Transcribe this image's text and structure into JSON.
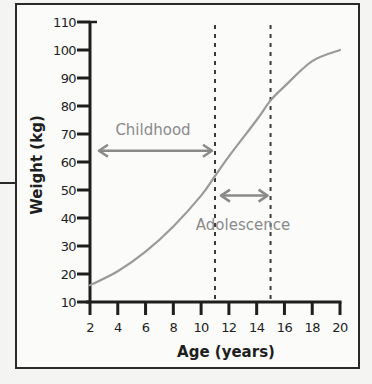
{
  "chart_data": {
    "type": "line",
    "title": "",
    "xlabel": "Age (years)",
    "ylabel": "Weight (kg)",
    "xlim": [
      2,
      20
    ],
    "ylim": [
      10,
      110
    ],
    "x_ticks": [
      2,
      4,
      6,
      8,
      10,
      12,
      14,
      16,
      18,
      20
    ],
    "y_ticks": [
      10,
      20,
      30,
      40,
      50,
      60,
      70,
      80,
      90,
      100,
      110
    ],
    "grid": false,
    "legend": null,
    "series": [
      {
        "name": "Weight",
        "color": "#9a9a9a",
        "x": [
          2,
          4,
          6,
          8,
          10,
          11,
          12,
          14,
          15,
          16,
          18,
          20
        ],
        "values": [
          16,
          21,
          28,
          37,
          48,
          55,
          62,
          75,
          82,
          87,
          96,
          100
        ]
      }
    ],
    "reference_lines": [
      {
        "axis": "x",
        "value": 11,
        "style": "dashed"
      },
      {
        "axis": "x",
        "value": 15,
        "style": "dashed"
      }
    ],
    "annotations": [
      {
        "text": "Childhood",
        "arrow": "double",
        "x_from": 2.5,
        "x_to": 11,
        "y": 64
      },
      {
        "text": "Adolescence",
        "arrow": "double",
        "x_from": 11,
        "x_to": 15,
        "y": 48
      }
    ]
  },
  "labels": {
    "xlabel": "Age (years)",
    "ylabel": "Weight (kg)",
    "childhood": "Childhood",
    "adolescence": "Adolescence"
  },
  "colors": {
    "axis": "#1e1e1e",
    "curve": "#9a9a9a",
    "annotation": "#8a8a8a",
    "frame": "#2a2a2a"
  }
}
